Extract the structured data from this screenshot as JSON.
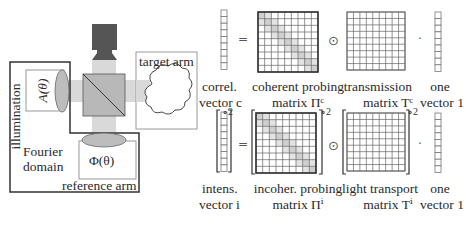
{
  "setup": {
    "illumination_label": "illumination",
    "amplitude_label": "A(θ)",
    "phase_label": "Φ(θ)",
    "fourier_label_line1": "Fourier",
    "fourier_label_line2": "domain",
    "reference_arm_label": "reference arm",
    "target_arm_label": "target arm",
    "colors": {
      "beam": "#d9d9d9",
      "camera": "#555555",
      "lens": "#bdbdbd",
      "beamsplitter": "#b8b8b8",
      "box_border": "#333333",
      "panel_border": "#999999"
    }
  },
  "equations": {
    "coherent": {
      "vector_label_line1": "correl.",
      "vector_label_line2": "vector c",
      "equals": "=",
      "probing_label_line1": "coherent probing",
      "probing_label_line2": "matrix Πᶜ",
      "hadamard": "⊙",
      "transport_label_line1": "transmission",
      "transport_label_line2": "matrix Tᶜ",
      "dot": "·",
      "ones_label_line1": "one",
      "ones_label_line2": "vector 1"
    },
    "incoherent": {
      "vector_label_line1": "intens.",
      "vector_label_line2": "vector i",
      "equals": "=",
      "power": "∘2",
      "probing_label_line1": "incoher. probing",
      "probing_label_line2": "matrix Πⁱ",
      "hadamard": "⊙",
      "transport_label_line1": "light transport",
      "transport_label_line2": "matrix Tⁱ",
      "dot": "·",
      "ones_label_line1": "one",
      "ones_label_line2": "vector 1"
    },
    "grid_size": 9
  }
}
